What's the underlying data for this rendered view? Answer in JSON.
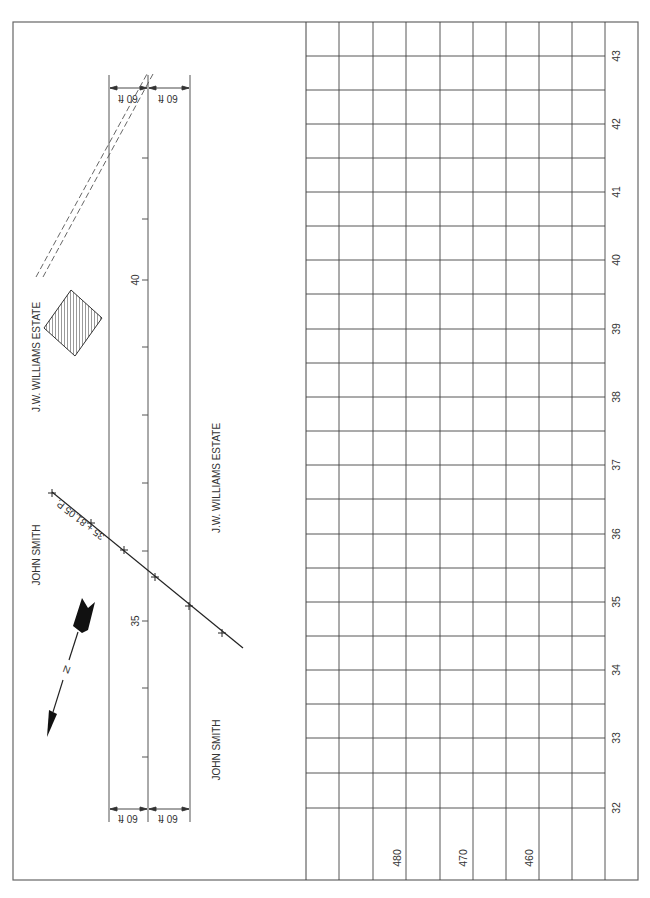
{
  "plan": {
    "centerline_station_labels": [
      {
        "text": "40",
        "y": 280
      },
      {
        "text": "35",
        "y": 621
      }
    ],
    "tick_ys": [
      158,
      219,
      280,
      347,
      415,
      483,
      551,
      621,
      688,
      757
    ],
    "dimension_top": {
      "left": "60 ft",
      "right": "60 ft"
    },
    "dimension_bottom": {
      "left": "60 ft",
      "right": "60 ft"
    },
    "property_labels": {
      "top_left": "J.W. WILLIAMS ESTATE",
      "mid_left": "JOHN SMITH",
      "mid_right": "J.W. WILLIAMS ESTATE",
      "bottom_right": "JOHN SMITH"
    },
    "crossing_label": "35 + 81.05 P.",
    "north_label": "N",
    "line_color": "#333333"
  },
  "profile": {
    "station_labels": [
      "43",
      "42",
      "41",
      "40",
      "39",
      "38",
      "37",
      "36",
      "35",
      "34",
      "33",
      "32"
    ],
    "elevation_labels": [
      "480",
      "470",
      "460"
    ],
    "grid_color": "#444444"
  }
}
